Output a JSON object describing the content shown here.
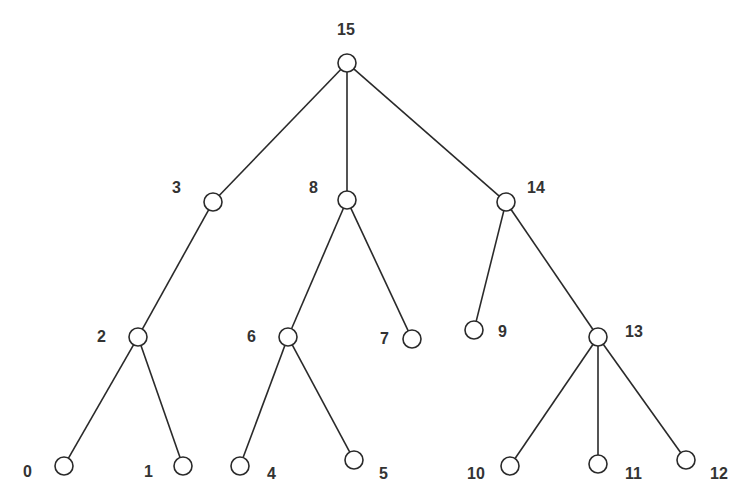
{
  "diagram": {
    "type": "tree",
    "colors": {
      "stroke": "#2a2a2a",
      "node_fill": "#ffffff",
      "label": "#333333"
    },
    "node_radius": 9,
    "nodes": [
      {
        "id": "15",
        "label": "15",
        "x": 347,
        "y": 63,
        "lx": 337,
        "ly": 22
      },
      {
        "id": "3",
        "label": "3",
        "x": 213,
        "y": 202,
        "lx": 172,
        "ly": 180
      },
      {
        "id": "8",
        "label": "8",
        "x": 347,
        "y": 200,
        "lx": 309,
        "ly": 180
      },
      {
        "id": "14",
        "label": "14",
        "x": 506,
        "y": 202,
        "lx": 527,
        "ly": 180
      },
      {
        "id": "2",
        "label": "2",
        "x": 138,
        "y": 337,
        "lx": 97,
        "ly": 329
      },
      {
        "id": "6",
        "label": "6",
        "x": 288,
        "y": 337,
        "lx": 247,
        "ly": 329
      },
      {
        "id": "7",
        "label": "7",
        "x": 412,
        "y": 339,
        "lx": 380,
        "ly": 331
      },
      {
        "id": "9",
        "label": "9",
        "x": 474,
        "y": 330,
        "lx": 498,
        "ly": 324
      },
      {
        "id": "13",
        "label": "13",
        "x": 598,
        "y": 337,
        "lx": 625,
        "ly": 324
      },
      {
        "id": "0",
        "label": "0",
        "x": 64,
        "y": 466,
        "lx": 23,
        "ly": 464
      },
      {
        "id": "1",
        "label": "1",
        "x": 183,
        "y": 466,
        "lx": 144,
        "ly": 464
      },
      {
        "id": "4",
        "label": "4",
        "x": 240,
        "y": 466,
        "lx": 267,
        "ly": 466
      },
      {
        "id": "5",
        "label": "5",
        "x": 354,
        "y": 460,
        "lx": 379,
        "ly": 466
      },
      {
        "id": "10",
        "label": "10",
        "x": 510,
        "y": 466,
        "lx": 467,
        "ly": 466
      },
      {
        "id": "11",
        "label": "11",
        "x": 598,
        "y": 464,
        "lx": 625,
        "ly": 466
      },
      {
        "id": "12",
        "label": "12",
        "x": 686,
        "y": 460,
        "lx": 710,
        "ly": 466
      }
    ],
    "edges": [
      [
        "15",
        "3"
      ],
      [
        "15",
        "8"
      ],
      [
        "15",
        "14"
      ],
      [
        "3",
        "2"
      ],
      [
        "2",
        "0"
      ],
      [
        "2",
        "1"
      ],
      [
        "8",
        "6"
      ],
      [
        "8",
        "7"
      ],
      [
        "6",
        "4"
      ],
      [
        "6",
        "5"
      ],
      [
        "14",
        "9"
      ],
      [
        "14",
        "13"
      ],
      [
        "13",
        "10"
      ],
      [
        "13",
        "11"
      ],
      [
        "13",
        "12"
      ]
    ]
  }
}
